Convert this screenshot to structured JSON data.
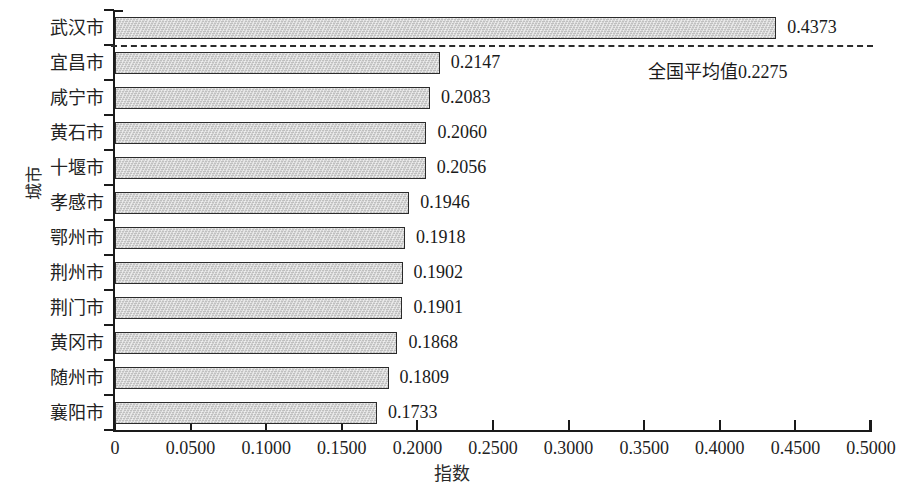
{
  "chart_data": {
    "type": "bar",
    "orientation": "horizontal",
    "title": "",
    "xlabel": "指数",
    "ylabel": "城市",
    "categories": [
      "武汉市",
      "宜昌市",
      "咸宁市",
      "黄石市",
      "十堰市",
      "孝感市",
      "鄂州市",
      "荆州市",
      "荆门市",
      "黄冈市",
      "随州市",
      "襄阳市"
    ],
    "values": [
      0.4373,
      0.2147,
      0.2083,
      0.206,
      0.2056,
      0.1946,
      0.1918,
      0.1902,
      0.1901,
      0.1868,
      0.1809,
      0.1733
    ],
    "value_labels": [
      "0.4373",
      "0.2147",
      "0.2083",
      "0.2060",
      "0.2056",
      "0.1946",
      "0.1918",
      "0.1902",
      "0.1901",
      "0.1868",
      "0.1809",
      "0.1733"
    ],
    "xlim": [
      0,
      0.5
    ],
    "xticks": [
      0,
      0.05,
      0.1,
      0.15,
      0.2,
      0.25,
      0.3,
      0.35,
      0.4,
      0.45,
      0.5
    ],
    "xtick_labels": [
      "0",
      "0.0500",
      "0.1000",
      "0.1500",
      "0.2000",
      "0.2500",
      "0.3000",
      "0.3500",
      "0.4000",
      "0.4500",
      "0.5000"
    ],
    "grid": false,
    "legend": false,
    "bar_color": "#c9c9c9",
    "bar_edge_color": "#2b2b2b",
    "annotations": [
      {
        "name": "national-average-line",
        "label": "全国平均值0.2275",
        "value": 0.2275,
        "style": "dashed-horizontal-reference-line",
        "color": "#2b2b2b"
      }
    ]
  }
}
